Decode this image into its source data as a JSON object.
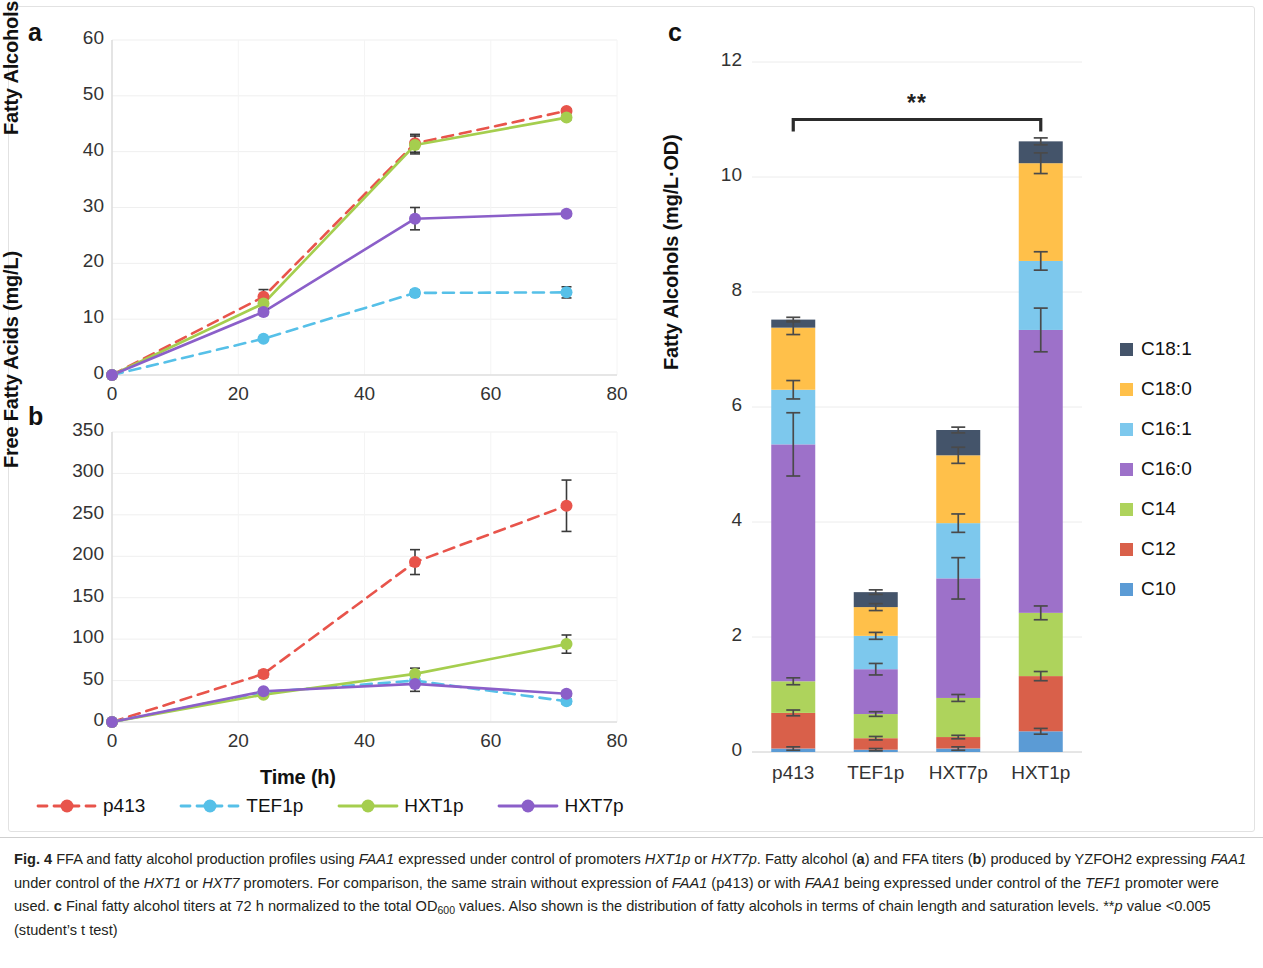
{
  "figure": {
    "label": "Fig. 4",
    "caption_parts": {
      "p1": "FFA and fatty alcohol production profiles using ",
      "i1": "FAA1",
      "p2": " expressed under control of promoters ",
      "i2": "HXT1p",
      "p3": " or ",
      "i3": "HXT7p",
      "p4": ". Fatty alcohol (",
      "b1": "a",
      "p5": ") and FFA titers (",
      "b2": "b",
      "p6": ") produced by YZFOH2 expressing ",
      "i4": "FAA1",
      "p7": " under control of the ",
      "i5": "HXT1",
      "p8": " or ",
      "i6": "HXT7",
      "p9": " promoters. For comparison, the same strain without expression of ",
      "i7": "FAA1",
      "p10": " (p413) or with ",
      "i8": "FAA1",
      "p11": " being expressed under control of the ",
      "i9": "TEF1",
      "p12": " promoter were used. ",
      "b3": "c",
      "p13": " Final fatty alcohol titers at 72 h normalized to the total OD",
      "sub1": "600",
      "p14": " values. Also shown is the distribution of fatty alcohols in terms of chain length and saturation levels. **",
      "i10": "p",
      "p15": " value <0.005 (student’s t test)"
    }
  },
  "panels": {
    "a": {
      "letter": "a"
    },
    "b": {
      "letter": "b"
    },
    "c": {
      "letter": "c"
    }
  },
  "series_colors": {
    "p413": "#E8544B",
    "TEF1p": "#56C0E8",
    "HXT1p": "#A5CE4E",
    "HXT7p": "#8B5FC9"
  },
  "line_legend": {
    "items": [
      {
        "label": "p413",
        "color": "#E8544B",
        "dashed": true
      },
      {
        "label": "TEF1p",
        "color": "#56C0E8",
        "dashed": true
      },
      {
        "label": "HXT1p",
        "color": "#A5CE4E",
        "dashed": false
      },
      {
        "label": "HXT7p",
        "color": "#8B5FC9",
        "dashed": false
      }
    ]
  },
  "bar_legend": {
    "items": [
      {
        "label": "C18:1",
        "color": "#44546A"
      },
      {
        "label": "C18:0",
        "color": "#FFC04A"
      },
      {
        "label": "C16:1",
        "color": "#7DC8ED"
      },
      {
        "label": "C16:0",
        "color": "#9D71C9"
      },
      {
        "label": "C14",
        "color": "#AED35C"
      },
      {
        "label": "C12",
        "color": "#D9604A"
      },
      {
        "label": "C10",
        "color": "#5B9BD5"
      }
    ]
  },
  "chart_data": [
    {
      "type": "line",
      "panel": "a",
      "title": "",
      "xlabel": "",
      "ylabel": "Fatty Alcohols (mg/L)",
      "xlim": [
        0,
        80
      ],
      "ylim": [
        0,
        60
      ],
      "xticks": [
        0,
        20,
        40,
        60,
        80
      ],
      "yticks": [
        0,
        10,
        20,
        30,
        40,
        50,
        60
      ],
      "grid": true,
      "legend_position": "bottom",
      "x": [
        0,
        24,
        48,
        72
      ],
      "series": [
        {
          "name": "p413",
          "color": "#E8544B",
          "dashed": true,
          "values": [
            0,
            14.0,
            41.5,
            47.3
          ],
          "errors": [
            0,
            1.3,
            1.6,
            0.4
          ]
        },
        {
          "name": "TEF1p",
          "color": "#56C0E8",
          "dashed": true,
          "values": [
            0,
            6.5,
            14.7,
            14.8
          ],
          "errors": [
            0,
            0.3,
            0.5,
            1.0
          ]
        },
        {
          "name": "HXT1p",
          "color": "#A5CE4E",
          "dashed": false,
          "values": [
            0,
            12.8,
            41.2,
            46.1
          ],
          "errors": [
            0,
            1.0,
            1.6,
            0.4
          ]
        },
        {
          "name": "HXT7p",
          "color": "#8B5FC9",
          "dashed": false,
          "values": [
            0,
            11.3,
            28.0,
            28.9
          ],
          "errors": [
            0,
            0.5,
            2.0,
            0.4
          ]
        }
      ]
    },
    {
      "type": "line",
      "panel": "b",
      "title": "",
      "xlabel": "Time (h)",
      "ylabel": "Free Fatty Acids (mg/L)",
      "xlim": [
        0,
        80
      ],
      "ylim": [
        0,
        350
      ],
      "xticks": [
        0,
        20,
        40,
        60,
        80
      ],
      "yticks": [
        0,
        50,
        100,
        150,
        200,
        250,
        300,
        350
      ],
      "grid": true,
      "legend_position": "bottom",
      "x": [
        0,
        24,
        48,
        72
      ],
      "series": [
        {
          "name": "p413",
          "color": "#E8544B",
          "dashed": true,
          "values": [
            0,
            58,
            193,
            261
          ],
          "errors": [
            0,
            4,
            15,
            31
          ]
        },
        {
          "name": "TEF1p",
          "color": "#56C0E8",
          "dashed": true,
          "values": [
            0,
            36,
            50,
            25
          ],
          "errors": [
            0,
            2,
            4,
            3
          ]
        },
        {
          "name": "HXT1p",
          "color": "#A5CE4E",
          "dashed": false,
          "values": [
            0,
            33,
            58,
            94
          ],
          "errors": [
            0,
            2,
            7,
            11
          ]
        },
        {
          "name": "HXT7p",
          "color": "#8B5FC9",
          "dashed": false,
          "values": [
            0,
            37,
            46,
            34
          ],
          "errors": [
            0,
            2,
            9,
            3
          ]
        }
      ]
    },
    {
      "type": "bar",
      "subtype": "stacked",
      "panel": "c",
      "title": "",
      "xlabel": "",
      "ylabel": "Fatty Alcohols (mg/L·OD)",
      "ylim": [
        0,
        12
      ],
      "yticks": [
        0,
        2,
        4,
        6,
        8,
        10,
        12
      ],
      "grid": true,
      "legend_position": "right",
      "categories": [
        "p413",
        "TEF1p",
        "HXT7p",
        "HXT1p"
      ],
      "totals": [
        7.52,
        2.78,
        5.6,
        10.62
      ],
      "series": [
        {
          "name": "C10",
          "color": "#5B9BD5",
          "values": [
            0.06,
            0.04,
            0.06,
            0.36
          ],
          "errors": [
            0.03,
            0.02,
            0.03,
            0.05
          ]
        },
        {
          "name": "C12",
          "color": "#D9604A",
          "values": [
            0.62,
            0.2,
            0.2,
            0.96
          ],
          "errors": [
            0.05,
            0.03,
            0.03,
            0.08
          ]
        },
        {
          "name": "C14",
          "color": "#AED35C",
          "values": [
            0.55,
            0.42,
            0.68,
            1.1
          ],
          "errors": [
            0.06,
            0.04,
            0.06,
            0.12
          ]
        },
        {
          "name": "C16:0",
          "color": "#9D71C9",
          "values": [
            4.12,
            0.78,
            2.08,
            4.92
          ],
          "errors": [
            0.55,
            0.1,
            0.36,
            0.38
          ]
        },
        {
          "name": "C16:1",
          "color": "#7DC8ED",
          "values": [
            0.95,
            0.58,
            0.96,
            1.2
          ],
          "errors": [
            0.16,
            0.06,
            0.16,
            0.16
          ]
        },
        {
          "name": "C18:0",
          "color": "#FFC04A",
          "values": [
            1.08,
            0.5,
            1.18,
            1.7
          ],
          "errors": [
            0.12,
            0.06,
            0.14,
            0.18
          ]
        },
        {
          "name": "C18:1",
          "color": "#44546A",
          "values": [
            0.14,
            0.26,
            0.44,
            0.38
          ],
          "errors": [
            0.04,
            0.04,
            0.05,
            0.06
          ]
        }
      ],
      "annotations": [
        {
          "type": "significance-bracket",
          "label": "**",
          "from": "p413",
          "to": "HXT1p",
          "y": 11.0
        }
      ]
    }
  ]
}
